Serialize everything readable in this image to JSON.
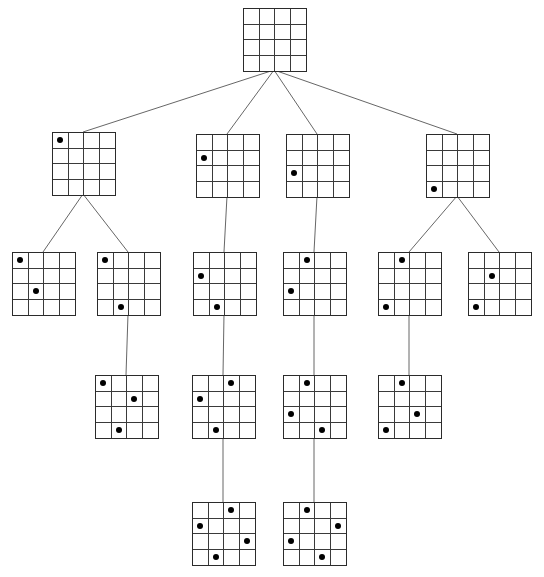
{
  "figure": {
    "type": "search-tree",
    "board_size": 4,
    "width": 544,
    "height": 577,
    "background_color": "#ffffff",
    "grid_line_color": "#3a3a3a",
    "border_color": "#2b2b2b",
    "edge_color": "#555555",
    "dot_color": "#000000"
  },
  "nodes": [
    {
      "id": "n0",
      "level": 0,
      "x": 243,
      "y": 8,
      "w": 62,
      "h": 62,
      "queens": []
    },
    {
      "id": "n1",
      "level": 1,
      "x": 52,
      "y": 132,
      "w": 62,
      "h": 62,
      "queens": [
        [
          0,
          0
        ]
      ]
    },
    {
      "id": "n2",
      "level": 1,
      "x": 196,
      "y": 134,
      "w": 62,
      "h": 62,
      "queens": [
        [
          1,
          0
        ]
      ]
    },
    {
      "id": "n3",
      "level": 1,
      "x": 286,
      "y": 134,
      "w": 62,
      "h": 62,
      "queens": [
        [
          2,
          0
        ]
      ]
    },
    {
      "id": "n4",
      "level": 1,
      "x": 426,
      "y": 134,
      "w": 62,
      "h": 62,
      "queens": [
        [
          3,
          0
        ]
      ]
    },
    {
      "id": "n5",
      "level": 2,
      "x": 12,
      "y": 252,
      "w": 62,
      "h": 62,
      "queens": [
        [
          0,
          0
        ],
        [
          2,
          1
        ]
      ]
    },
    {
      "id": "n6",
      "level": 2,
      "x": 97,
      "y": 252,
      "w": 62,
      "h": 62,
      "queens": [
        [
          0,
          0
        ],
        [
          3,
          1
        ]
      ]
    },
    {
      "id": "n7",
      "level": 2,
      "x": 193,
      "y": 252,
      "w": 62,
      "h": 62,
      "queens": [
        [
          1,
          0
        ],
        [
          3,
          1
        ]
      ]
    },
    {
      "id": "n8",
      "level": 2,
      "x": 283,
      "y": 252,
      "w": 62,
      "h": 62,
      "queens": [
        [
          0,
          1
        ],
        [
          2,
          0
        ]
      ]
    },
    {
      "id": "n9",
      "level": 2,
      "x": 378,
      "y": 252,
      "w": 62,
      "h": 62,
      "queens": [
        [
          0,
          1
        ],
        [
          3,
          0
        ]
      ]
    },
    {
      "id": "n10",
      "level": 2,
      "x": 468,
      "y": 252,
      "w": 62,
      "h": 62,
      "queens": [
        [
          1,
          1
        ],
        [
          3,
          0
        ]
      ]
    },
    {
      "id": "n11",
      "level": 3,
      "x": 95,
      "y": 375,
      "w": 62,
      "h": 62,
      "queens": [
        [
          0,
          0
        ],
        [
          1,
          2
        ],
        [
          3,
          1
        ]
      ]
    },
    {
      "id": "n12",
      "level": 3,
      "x": 192,
      "y": 375,
      "w": 62,
      "h": 62,
      "queens": [
        [
          0,
          2
        ],
        [
          1,
          0
        ],
        [
          3,
          1
        ]
      ]
    },
    {
      "id": "n13",
      "level": 3,
      "x": 283,
      "y": 375,
      "w": 62,
      "h": 62,
      "queens": [
        [
          0,
          1
        ],
        [
          2,
          0
        ],
        [
          3,
          2
        ]
      ]
    },
    {
      "id": "n14",
      "level": 3,
      "x": 378,
      "y": 375,
      "w": 62,
      "h": 62,
      "queens": [
        [
          0,
          1
        ],
        [
          2,
          2
        ],
        [
          3,
          0
        ]
      ]
    },
    {
      "id": "n15",
      "level": 4,
      "x": 192,
      "y": 502,
      "w": 62,
      "h": 62,
      "queens": [
        [
          0,
          2
        ],
        [
          1,
          0
        ],
        [
          2,
          3
        ],
        [
          3,
          1
        ]
      ]
    },
    {
      "id": "n16",
      "level": 4,
      "x": 283,
      "y": 502,
      "w": 62,
      "h": 62,
      "queens": [
        [
          0,
          1
        ],
        [
          1,
          3
        ],
        [
          2,
          0
        ],
        [
          3,
          2
        ]
      ]
    }
  ],
  "edges": [
    {
      "from": "n0",
      "to": "n1"
    },
    {
      "from": "n0",
      "to": "n2"
    },
    {
      "from": "n0",
      "to": "n3"
    },
    {
      "from": "n0",
      "to": "n4"
    },
    {
      "from": "n1",
      "to": "n5"
    },
    {
      "from": "n1",
      "to": "n6"
    },
    {
      "from": "n2",
      "to": "n7"
    },
    {
      "from": "n3",
      "to": "n8"
    },
    {
      "from": "n4",
      "to": "n9"
    },
    {
      "from": "n4",
      "to": "n10"
    },
    {
      "from": "n6",
      "to": "n11"
    },
    {
      "from": "n7",
      "to": "n12"
    },
    {
      "from": "n8",
      "to": "n13"
    },
    {
      "from": "n9",
      "to": "n14"
    },
    {
      "from": "n12",
      "to": "n15"
    },
    {
      "from": "n13",
      "to": "n16"
    }
  ]
}
